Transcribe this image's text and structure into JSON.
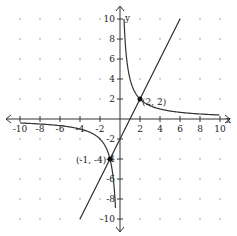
{
  "chart_data": {
    "type": "line",
    "title": "",
    "xlabel": "x",
    "ylabel": "y",
    "xlim": [
      -10,
      10
    ],
    "ylim": [
      -10,
      10
    ],
    "grid": "dots",
    "x_ticks": [
      -10,
      -8,
      -6,
      -4,
      -2,
      2,
      4,
      6,
      8,
      10
    ],
    "y_ticks": [
      -10,
      -8,
      -6,
      -4,
      -2,
      2,
      4,
      6,
      8,
      10
    ],
    "series": [
      {
        "name": "hyperbola",
        "equation": "y = 4/x"
      },
      {
        "name": "line",
        "equation": "y = 2x - 2"
      }
    ],
    "points": [
      {
        "label": "(2, 2)",
        "x": 2,
        "y": 2
      },
      {
        "label": "(-1, -4)",
        "x": -1,
        "y": -4
      }
    ]
  },
  "labels": {
    "x_axis": "x",
    "y_axis": "y",
    "point_a": "(2, 2)",
    "point_b": "(-1, -4)"
  },
  "colors": {
    "curve": "#333333",
    "axis": "#333333",
    "grid_dot": "#888888"
  }
}
